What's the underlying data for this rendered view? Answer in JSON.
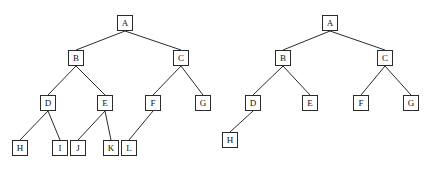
{
  "figure": {
    "title": "",
    "background_color": "#ffffff",
    "node_fill": "#ffffff",
    "node_stroke": "#2b2b2b",
    "edge_stroke": "#2b2b2b",
    "node_size": 16
  },
  "diagrams": [
    {
      "id": "left-tree",
      "name": "binary-tree-left",
      "nodes": [
        {
          "label": "A",
          "x": 117,
          "y": 15,
          "w": 16,
          "h": 16
        },
        {
          "label": "B",
          "x": 68,
          "y": 50,
          "w": 16,
          "h": 16
        },
        {
          "label": "C",
          "x": 173,
          "y": 50,
          "w": 16,
          "h": 16
        },
        {
          "label": "D",
          "x": 40,
          "y": 95,
          "w": 16,
          "h": 16
        },
        {
          "label": "E",
          "x": 97,
          "y": 95,
          "w": 16,
          "h": 16
        },
        {
          "label": "F",
          "x": 145,
          "y": 95,
          "w": 16,
          "h": 16
        },
        {
          "label": "G",
          "x": 195,
          "y": 95,
          "w": 16,
          "h": 16
        },
        {
          "label": "H",
          "x": 12,
          "y": 140,
          "w": 16,
          "h": 16
        },
        {
          "label": "I",
          "x": 52,
          "y": 140,
          "w": 16,
          "h": 16
        },
        {
          "label": "J",
          "x": 70,
          "y": 140,
          "w": 16,
          "h": 16
        },
        {
          "label": "K",
          "x": 103,
          "y": 140,
          "w": 16,
          "h": 16
        },
        {
          "label": "L",
          "x": 121,
          "y": 140,
          "w": 16,
          "h": 16
        }
      ],
      "edges": [
        {
          "from": "A",
          "to": "B"
        },
        {
          "from": "A",
          "to": "C"
        },
        {
          "from": "B",
          "to": "D"
        },
        {
          "from": "B",
          "to": "E"
        },
        {
          "from": "C",
          "to": "F"
        },
        {
          "from": "C",
          "to": "G"
        },
        {
          "from": "D",
          "to": "H"
        },
        {
          "from": "D",
          "to": "I"
        },
        {
          "from": "E",
          "to": "J"
        },
        {
          "from": "E",
          "to": "K"
        },
        {
          "from": "F",
          "to": "L"
        }
      ]
    },
    {
      "id": "right-tree",
      "name": "binary-tree-right",
      "nodes": [
        {
          "label": "A",
          "x": 322,
          "y": 15,
          "w": 16,
          "h": 16
        },
        {
          "label": "B",
          "x": 275,
          "y": 50,
          "w": 16,
          "h": 16
        },
        {
          "label": "C",
          "x": 377,
          "y": 50,
          "w": 16,
          "h": 16
        },
        {
          "label": "D",
          "x": 245,
          "y": 95,
          "w": 16,
          "h": 16
        },
        {
          "label": "E",
          "x": 302,
          "y": 95,
          "w": 16,
          "h": 16
        },
        {
          "label": "F",
          "x": 353,
          "y": 95,
          "w": 16,
          "h": 16
        },
        {
          "label": "G",
          "x": 403,
          "y": 95,
          "w": 16,
          "h": 16
        },
        {
          "label": "H",
          "x": 222,
          "y": 132,
          "w": 16,
          "h": 16
        }
      ],
      "edges": [
        {
          "from": "A",
          "to": "B"
        },
        {
          "from": "A",
          "to": "C"
        },
        {
          "from": "B",
          "to": "D"
        },
        {
          "from": "B",
          "to": "E"
        },
        {
          "from": "C",
          "to": "F"
        },
        {
          "from": "C",
          "to": "G"
        },
        {
          "from": "D",
          "to": "H"
        }
      ]
    }
  ]
}
